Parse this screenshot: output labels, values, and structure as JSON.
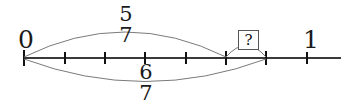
{
  "figure": {
    "type": "number-line-fraction-diagram",
    "axis": {
      "label_start": "0",
      "label_end": "1",
      "line_color": "#3a3a3a",
      "tick_color": "#111111",
      "line_y": 58,
      "line_x_start": 24,
      "line_x_end": 341,
      "tick_positions": [
        24,
        65,
        105,
        145,
        186,
        226,
        266,
        307
      ],
      "tick_values": [
        "0",
        "1/7",
        "2/7",
        "3/7",
        "4/7",
        "5/7",
        "6/7",
        "1"
      ]
    },
    "arcs": [
      {
        "name": "upper-arc",
        "label_numerator": "5",
        "label_denominator": "7",
        "from_x": 24,
        "to_x": 226,
        "direction": "above",
        "color": "#6e6e6e"
      },
      {
        "name": "lower-arc",
        "label_numerator": "6",
        "label_denominator": "7",
        "from_x": 24,
        "to_x": 266,
        "direction": "below",
        "color": "#6e6e6e"
      },
      {
        "name": "unknown-arc",
        "label": "?",
        "from_x": 226,
        "to_x": 266,
        "direction": "above",
        "color": "#6e6e6e"
      }
    ],
    "unknown_box": {
      "text": "?",
      "border_color": "#555555",
      "fill_color": "#ffffff"
    },
    "fractions": {
      "top": {
        "numerator": "5",
        "denominator": "7"
      },
      "bottom": {
        "numerator": "6",
        "denominator": "7"
      }
    }
  }
}
